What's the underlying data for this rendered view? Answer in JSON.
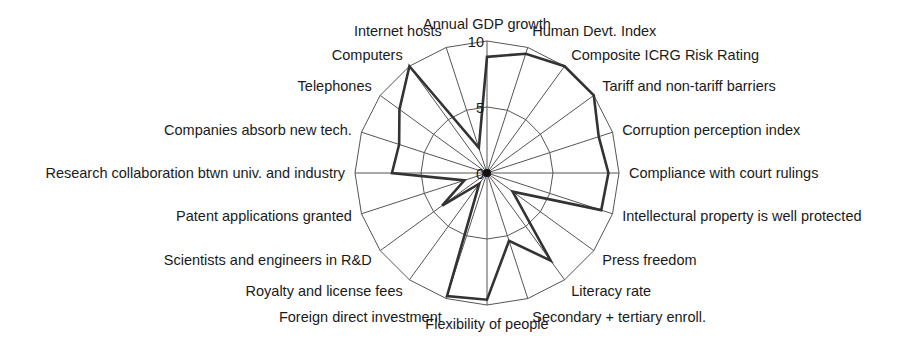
{
  "chart_data": {
    "type": "radar",
    "title": "",
    "range": [
      0,
      10
    ],
    "rings": [
      5,
      10
    ],
    "tick_labels": [
      "0",
      "5",
      "10"
    ],
    "grid": true,
    "legend": null,
    "categories": [
      "Annual GDP growth",
      "Human Devt. Index",
      "Composite ICRG Risk Rating",
      "Tariff and non-tariff barriers",
      "Corruption perception index",
      "Compliance with court rulings",
      "Intellectural property is well protected",
      "Press freedom",
      "Literacy rate",
      "Secondary + tertiary enroll.",
      "Flexibility of people",
      "Foreign direct investment",
      "Royalty and license fees",
      "Scientists and engineers in R&D",
      "Patent applications granted",
      "Research collaboration btwn univ. and industry",
      "Companies absorb new tech.",
      "Telephones",
      "Computers",
      "Internet hosts"
    ],
    "series": [
      {
        "name": "Score",
        "color": "#333333",
        "values": [
          8.8,
          9.5,
          10,
          10,
          8.9,
          9.2,
          9.1,
          2.4,
          8.2,
          5.4,
          9.6,
          9.8,
          1.0,
          4.2,
          1.8,
          7.2,
          7.0,
          8.2,
          10,
          2.0
        ]
      }
    ]
  }
}
